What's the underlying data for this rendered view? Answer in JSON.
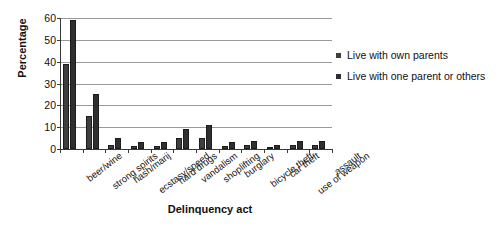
{
  "chart_data": {
    "type": "bar",
    "title": "",
    "xlabel": "Delinquency act",
    "ylabel": "Percentage",
    "ylim": [
      0,
      60
    ],
    "yticks": [
      0,
      10,
      20,
      30,
      40,
      50,
      60
    ],
    "grid": true,
    "legend_position": "right",
    "categories": [
      "beer/wine",
      "strong spirits",
      "hash/marij",
      "ecstasy/speed",
      "hard drugs",
      "vandalism",
      "shoplifting",
      "burglary",
      "bicycle theft",
      "car theft",
      "use of weapon",
      "assault"
    ],
    "series": [
      {
        "name": "Live with own parents",
        "color": "#3f3f3f",
        "values": [
          39,
          15,
          2,
          1.5,
          1.5,
          5,
          5,
          1.5,
          2,
          1,
          2,
          2
        ]
      },
      {
        "name": "Live with one parent or others",
        "color": "#2f2f2f",
        "values": [
          59,
          25,
          5,
          3,
          3,
          9,
          11,
          3,
          3.5,
          2,
          3.5,
          3.5
        ]
      }
    ]
  },
  "legend": {
    "items": [
      {
        "label": "Live with own parents"
      },
      {
        "label": "Live with one parent or others"
      }
    ]
  },
  "axes": {
    "y_title": "Percentage",
    "x_title": "Delinquency act"
  },
  "colors": {
    "series_one": "#3f3f3f",
    "series_two": "#2f2f2f",
    "gridline": "#9a9a9a",
    "axis": "#3a3a3a",
    "background": "#ffffff"
  }
}
